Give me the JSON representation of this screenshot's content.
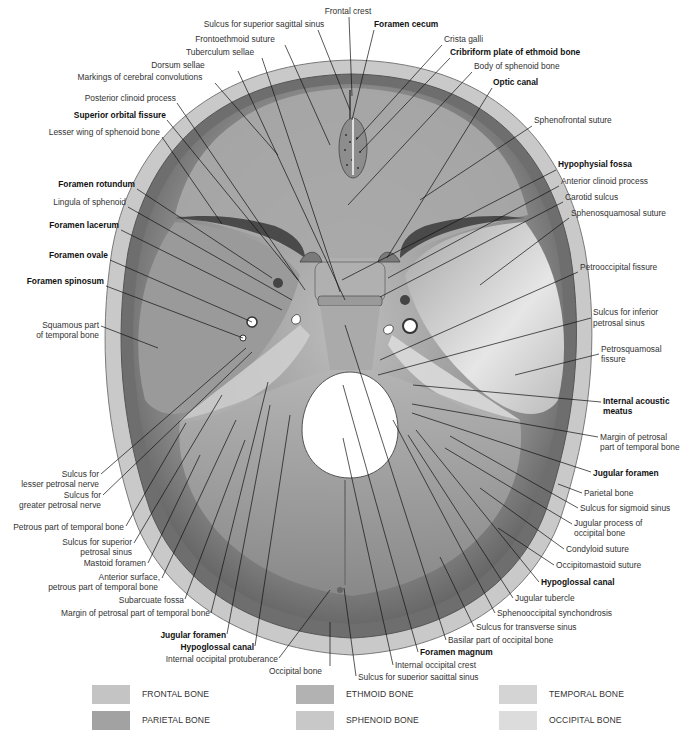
{
  "figure": {
    "labels": [
      {
        "id": "frontal-crest",
        "text": "Frontal crest",
        "bold": false,
        "x": 348,
        "y": 14,
        "anchor": "middle",
        "lx1": 349,
        "ly1": 17,
        "lx2": 352,
        "ly2": 96
      },
      {
        "id": "sulcus-superior-sagittal-sinus-top",
        "text": "Sulcus for superior sagittal sinus",
        "bold": false,
        "x": 264,
        "y": 27,
        "anchor": "middle",
        "lx1": 318,
        "ly1": 30,
        "lx2": 350,
        "ly2": 110
      },
      {
        "id": "foramen-cecum",
        "text": "Foramen cecum",
        "bold": true,
        "x": 374,
        "y": 27,
        "anchor": "start",
        "lx1": 374,
        "ly1": 30,
        "lx2": 352,
        "ly2": 120
      },
      {
        "id": "frontoethmoid-suture",
        "text": "Frontoethmoid suture",
        "bold": false,
        "x": 235,
        "y": 42,
        "anchor": "middle",
        "lx1": 285,
        "ly1": 45,
        "lx2": 330,
        "ly2": 145
      },
      {
        "id": "crista-galli",
        "text": "Crista galli",
        "bold": false,
        "x": 444,
        "y": 42,
        "anchor": "start",
        "lx1": 442,
        "ly1": 45,
        "lx2": 356,
        "ly2": 140
      },
      {
        "id": "tuberculum-sellae",
        "text": "Tuberculum sellae",
        "bold": false,
        "x": 220,
        "y": 55,
        "anchor": "middle",
        "lx1": 262,
        "ly1": 58,
        "lx2": 340,
        "ly2": 292
      },
      {
        "id": "cribriform-plate",
        "text": "Cribriform plate of ethmoid bone",
        "bold": true,
        "x": 450,
        "y": 55,
        "anchor": "start",
        "lx1": 450,
        "ly1": 58,
        "lx2": 360,
        "ly2": 152
      },
      {
        "id": "dorsum-sellae",
        "text": "Dorsum sellae",
        "bold": false,
        "x": 178,
        "y": 68,
        "anchor": "middle",
        "lx1": 238,
        "ly1": 71,
        "lx2": 345,
        "ly2": 300
      },
      {
        "id": "body-of-sphenoid",
        "text": "Body of sphenoid bone",
        "bold": false,
        "x": 474,
        "y": 69,
        "anchor": "start",
        "lx1": 472,
        "ly1": 72,
        "lx2": 348,
        "ly2": 205
      },
      {
        "id": "markings-cerebral-convolutions",
        "text": "Markings of cerebral convolutions",
        "bold": false,
        "x": 140,
        "y": 80,
        "anchor": "middle",
        "lx1": 215,
        "ly1": 83,
        "lx2": 278,
        "ly2": 155
      },
      {
        "id": "optic-canal",
        "text": "Optic canal",
        "bold": true,
        "x": 493,
        "y": 85,
        "anchor": "start",
        "lx1": 492,
        "ly1": 88,
        "lx2": 387,
        "ly2": 258
      },
      {
        "id": "posterior-clinoid-process",
        "text": "Posterior clinoid process",
        "bold": false,
        "x": 176,
        "y": 101,
        "anchor": "end",
        "lx1": 177,
        "ly1": 103,
        "lx2": 305,
        "ly2": 290
      },
      {
        "id": "superior-orbital-fissure",
        "text": "Superior orbital fissure",
        "bold": true,
        "x": 166,
        "y": 118,
        "anchor": "end",
        "lx1": 167,
        "ly1": 120,
        "lx2": 298,
        "ly2": 280
      },
      {
        "id": "lesser-wing-sphenoid",
        "text": "Lesser wing of sphenoid bone",
        "bold": false,
        "x": 160,
        "y": 135,
        "anchor": "end",
        "lx1": 162,
        "ly1": 137,
        "lx2": 222,
        "ly2": 224
      },
      {
        "id": "sphenofrontal-suture",
        "text": "Sphenofrontal suture",
        "bold": false,
        "x": 534,
        "y": 123,
        "anchor": "start",
        "lx1": 532,
        "ly1": 126,
        "lx2": 420,
        "ly2": 200
      },
      {
        "id": "hypophysial-fossa",
        "text": "Hypophysial fossa",
        "bold": true,
        "x": 558,
        "y": 167,
        "anchor": "start",
        "lx1": 556,
        "ly1": 170,
        "lx2": 342,
        "ly2": 280
      },
      {
        "id": "anterior-clinoid-process",
        "text": "Anterior clinoid process",
        "bold": false,
        "x": 561,
        "y": 184,
        "anchor": "start",
        "lx1": 559,
        "ly1": 186,
        "lx2": 388,
        "ly2": 278
      },
      {
        "id": "carotid-sulcus",
        "text": "Carotid sulcus",
        "bold": false,
        "x": 565,
        "y": 200,
        "anchor": "start",
        "lx1": 563,
        "ly1": 202,
        "lx2": 380,
        "ly2": 297
      },
      {
        "id": "sphenosquamosal-suture",
        "text": "Sphenosquamosal suture",
        "bold": false,
        "x": 571,
        "y": 216,
        "anchor": "start",
        "lx1": 569,
        "ly1": 218,
        "lx2": 480,
        "ly2": 285
      },
      {
        "id": "foramen-rotundum",
        "text": "Foramen rotundum",
        "bold": true,
        "x": 135,
        "y": 187,
        "anchor": "end",
        "lx1": 137,
        "ly1": 189,
        "lx2": 272,
        "ly2": 278
      },
      {
        "id": "lingula-of-sphenoid",
        "text": "Lingula of sphenoid",
        "bold": false,
        "x": 126,
        "y": 205,
        "anchor": "end",
        "lx1": 128,
        "ly1": 207,
        "lx2": 292,
        "ly2": 300
      },
      {
        "id": "foramen-lacerum",
        "text": "Foramen lacerum",
        "bold": true,
        "x": 119,
        "y": 228,
        "anchor": "end",
        "lx1": 121,
        "ly1": 230,
        "lx2": 282,
        "ly2": 310
      },
      {
        "id": "foramen-ovale",
        "text": "Foramen ovale",
        "bold": true,
        "x": 108,
        "y": 258,
        "anchor": "end",
        "lx1": 110,
        "ly1": 260,
        "lx2": 252,
        "ly2": 322
      },
      {
        "id": "foramen-spinosum",
        "text": "Foramen spinosum",
        "bold": true,
        "x": 104,
        "y": 284,
        "anchor": "end",
        "lx1": 106,
        "ly1": 286,
        "lx2": 243,
        "ly2": 338
      },
      {
        "id": "petrooccipital-fissure",
        "text": "Petrooccipital fissure",
        "bold": false,
        "x": 580,
        "y": 270,
        "anchor": "start",
        "lx1": 578,
        "ly1": 272,
        "lx2": 380,
        "ly2": 360
      },
      {
        "id": "squamous-part-temporal-1",
        "text": "Squamous part",
        "bold": false,
        "x": 99,
        "y": 328,
        "anchor": "end",
        "lx1": 101,
        "ly1": 326,
        "lx2": 158,
        "ly2": 348
      },
      {
        "id": "squamous-part-temporal-2",
        "text": "of temporal bone",
        "bold": false,
        "x": 99,
        "y": 338,
        "anchor": "end"
      },
      {
        "id": "sulcus-inferior-petrosal-1",
        "text": "Sulcus for inferior",
        "bold": false,
        "x": 593,
        "y": 315,
        "anchor": "start",
        "lx1": 591,
        "ly1": 318,
        "lx2": 378,
        "ly2": 375
      },
      {
        "id": "sulcus-inferior-petrosal-2",
        "text": "petrosal sinus",
        "bold": false,
        "x": 593,
        "y": 326,
        "anchor": "start"
      },
      {
        "id": "petrosquamosal-fissure-1",
        "text": "Petrosquamosal",
        "bold": false,
        "x": 601,
        "y": 352,
        "anchor": "start",
        "lx1": 599,
        "ly1": 354,
        "lx2": 515,
        "ly2": 375
      },
      {
        "id": "petrosquamosal-fissure-2",
        "text": "fissure",
        "bold": false,
        "x": 601,
        "y": 362,
        "anchor": "start"
      },
      {
        "id": "internal-acoustic-meatus-1",
        "text": "Internal acoustic",
        "bold": true,
        "x": 603,
        "y": 404,
        "anchor": "start",
        "lx1": 601,
        "ly1": 402,
        "lx2": 413,
        "ly2": 385
      },
      {
        "id": "internal-acoustic-meatus-2",
        "text": "meatus",
        "bold": true,
        "x": 603,
        "y": 414,
        "anchor": "start"
      },
      {
        "id": "margin-petrosal-right-1",
        "text": "Margin of petrosal",
        "bold": false,
        "x": 600,
        "y": 440,
        "anchor": "start",
        "lx1": 598,
        "ly1": 437,
        "lx2": 412,
        "ly2": 404
      },
      {
        "id": "margin-petrosal-right-2",
        "text": "part of temporal bone",
        "bold": false,
        "x": 600,
        "y": 450,
        "anchor": "start"
      },
      {
        "id": "jugular-foramen-right",
        "text": "Jugular foramen",
        "bold": true,
        "x": 593,
        "y": 476,
        "anchor": "start",
        "lx1": 591,
        "ly1": 472,
        "lx2": 412,
        "ly2": 413
      },
      {
        "id": "parietal-bone",
        "text": "Parietal bone",
        "bold": false,
        "x": 584,
        "y": 496,
        "anchor": "start",
        "lx1": 582,
        "ly1": 493,
        "lx2": 558,
        "ly2": 484
      },
      {
        "id": "sulcus-sigmoid-sinus",
        "text": "Sulcus for sigmoid sinus",
        "bold": false,
        "x": 580,
        "y": 511,
        "anchor": "start",
        "lx1": 578,
        "ly1": 508,
        "lx2": 450,
        "ly2": 436
      },
      {
        "id": "jugular-process-occipital-1",
        "text": "Jugular process of",
        "bold": false,
        "x": 574,
        "y": 526,
        "anchor": "start",
        "lx1": 572,
        "ly1": 524,
        "lx2": 445,
        "ly2": 448
      },
      {
        "id": "jugular-process-occipital-2",
        "text": "occipital bone",
        "bold": false,
        "x": 574,
        "y": 536,
        "anchor": "start"
      },
      {
        "id": "condyloid-suture",
        "text": "Condyloid suture",
        "bold": false,
        "x": 566,
        "y": 552,
        "anchor": "start",
        "lx1": 564,
        "ly1": 549,
        "lx2": 480,
        "ly2": 488
      },
      {
        "id": "occipitomastoid-suture",
        "text": "Occipitomastoid suture",
        "bold": false,
        "x": 556,
        "y": 568,
        "anchor": "start",
        "lx1": 554,
        "ly1": 565,
        "lx2": 498,
        "ly2": 528
      },
      {
        "id": "hypoglossal-canal-right",
        "text": "Hypoglossal canal",
        "bold": true,
        "x": 541,
        "y": 585,
        "anchor": "start",
        "lx1": 539,
        "ly1": 582,
        "lx2": 416,
        "ly2": 430
      },
      {
        "id": "jugular-tubercle",
        "text": "Jugular tubercle",
        "bold": false,
        "x": 515,
        "y": 601,
        "anchor": "start",
        "lx1": 513,
        "ly1": 598,
        "lx2": 408,
        "ly2": 435
      },
      {
        "id": "sphenooccipital-synchondrosis",
        "text": "Sphenooccipital synchondrosis",
        "bold": false,
        "x": 497,
        "y": 616,
        "anchor": "start",
        "lx1": 495,
        "ly1": 613,
        "lx2": 393,
        "ly2": 420
      },
      {
        "id": "sulcus-transverse-sinus",
        "text": "Sulcus for transverse sinus",
        "bold": false,
        "x": 476,
        "y": 630,
        "anchor": "start",
        "lx1": 474,
        "ly1": 627,
        "lx2": 440,
        "ly2": 557
      },
      {
        "id": "basilar-part-occipital",
        "text": "Basilar part of occipital bone",
        "bold": false,
        "x": 448,
        "y": 643,
        "anchor": "start",
        "lx1": 446,
        "ly1": 640,
        "lx2": 345,
        "ly2": 325
      },
      {
        "id": "foramen-magnum",
        "text": "Foramen magnum",
        "bold": true,
        "x": 420,
        "y": 655,
        "anchor": "start",
        "lx1": 418,
        "ly1": 652,
        "lx2": 343,
        "ly2": 385
      },
      {
        "id": "internal-occipital-crest",
        "text": "Internal occipital crest",
        "bold": false,
        "x": 395,
        "y": 668,
        "anchor": "start",
        "lx1": 393,
        "ly1": 665,
        "lx2": 343,
        "ly2": 438
      },
      {
        "id": "sulcus-superior-sagittal-sinus-bottom",
        "text": "Sulcus for superior sagittal sinus",
        "bold": false,
        "x": 358,
        "y": 680,
        "anchor": "start",
        "lx1": 356,
        "ly1": 676,
        "lx2": 344,
        "ly2": 588
      },
      {
        "id": "occipital-bone",
        "text": "Occipital bone",
        "bold": false,
        "x": 322,
        "y": 674,
        "anchor": "end",
        "lx1": 330,
        "ly1": 666,
        "lx2": 330,
        "ly2": 622
      },
      {
        "id": "internal-occipital-protuberance",
        "text": "Internal occipital protuberance",
        "bold": false,
        "x": 278,
        "y": 662,
        "anchor": "end",
        "lx1": 279,
        "ly1": 658,
        "lx2": 330,
        "ly2": 590
      },
      {
        "id": "hypoglossal-canal-left",
        "text": "Hypoglossal canal",
        "bold": true,
        "x": 254,
        "y": 650,
        "anchor": "end",
        "lx1": 255,
        "ly1": 646,
        "lx2": 290,
        "ly2": 415
      },
      {
        "id": "jugular-foramen-left",
        "text": "Jugular foramen",
        "bold": true,
        "x": 226,
        "y": 638,
        "anchor": "end",
        "lx1": 227,
        "ly1": 634,
        "lx2": 270,
        "ly2": 405
      },
      {
        "id": "margin-petrosal-left",
        "text": "Margin of petrosal part of temporal bone",
        "bold": false,
        "x": 210,
        "y": 616,
        "anchor": "end",
        "lx1": 211,
        "ly1": 613,
        "lx2": 268,
        "ly2": 382
      },
      {
        "id": "subarcuate-fossa",
        "text": "Subarcuate fossa",
        "bold": false,
        "x": 184,
        "y": 603,
        "anchor": "end",
        "lx1": 185,
        "ly1": 599,
        "lx2": 245,
        "ly2": 440
      },
      {
        "id": "anterior-surface-petrous-1",
        "text": "Anterior surface,",
        "bold": false,
        "x": 160,
        "y": 580,
        "anchor": "end",
        "lx1": 162,
        "ly1": 578,
        "lx2": 236,
        "ly2": 420
      },
      {
        "id": "anterior-surface-petrous-2",
        "text": "petrous part of temporal bone",
        "bold": false,
        "x": 158,
        "y": 590,
        "anchor": "end"
      },
      {
        "id": "mastoid-foramen",
        "text": "Mastoid foramen",
        "bold": false,
        "x": 146,
        "y": 566,
        "anchor": "end",
        "lx1": 148,
        "ly1": 563,
        "lx2": 200,
        "ly2": 455
      },
      {
        "id": "sulcus-superior-petrosal-1",
        "text": "Sulcus for superior",
        "bold": false,
        "x": 132,
        "y": 545,
        "anchor": "end",
        "lx1": 134,
        "ly1": 543,
        "lx2": 222,
        "ly2": 395
      },
      {
        "id": "sulcus-superior-petrosal-2",
        "text": "petrosal sinus",
        "bold": false,
        "x": 132,
        "y": 555,
        "anchor": "end"
      },
      {
        "id": "petrous-part-temporal",
        "text": "Petrous part of temporal bone",
        "bold": false,
        "x": 124,
        "y": 530,
        "anchor": "end",
        "lx1": 126,
        "ly1": 526,
        "lx2": 186,
        "ly2": 423
      },
      {
        "id": "sulcus-greater-petrosal-1",
        "text": "Sulcus for",
        "bold": false,
        "x": 101,
        "y": 498,
        "anchor": "end",
        "lx1": 103,
        "ly1": 495,
        "lx2": 252,
        "ly2": 352
      },
      {
        "id": "sulcus-greater-petrosal-2",
        "text": "greater petrosal nerve",
        "bold": false,
        "x": 101,
        "y": 508,
        "anchor": "end"
      },
      {
        "id": "sulcus-lesser-petrosal-1",
        "text": "Sulcus for",
        "bold": false,
        "x": 99,
        "y": 477,
        "anchor": "end",
        "lx1": 101,
        "ly1": 474,
        "lx2": 246,
        "ly2": 348
      },
      {
        "id": "sulcus-lesser-petrosal-2",
        "text": "lesser petrosal nerve",
        "bold": false,
        "x": 99,
        "y": 487,
        "anchor": "end"
      }
    ]
  },
  "legend": {
    "items": [
      {
        "label": "FRONTAL BONE",
        "color": "#c4c4c4"
      },
      {
        "label": "PARIETAL BONE",
        "color": "#a2a2a2"
      },
      {
        "label": "ETHMOID BONE",
        "color": "#b2b2b2"
      },
      {
        "label": "SPHENOID BONE",
        "color": "#c8c8c8"
      },
      {
        "label": "TEMPORAL BONE",
        "color": "#d4d4d4"
      },
      {
        "label": "OCCIPITAL BONE",
        "color": "#dcdcdc"
      }
    ]
  }
}
